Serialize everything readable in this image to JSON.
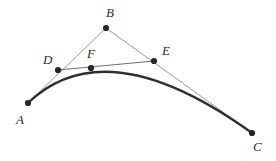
{
  "figure": {
    "canvas": {
      "width": 276,
      "height": 161
    },
    "colors": {
      "background": "#ffffff",
      "curve": "#2f2f2f",
      "control_line": "#8a8a8a",
      "chord_line": "#6e6e6e",
      "point_fill": "#262626",
      "label_text": "#2b2b2b"
    },
    "points": [
      {
        "id": "A",
        "label": "A",
        "x": 28,
        "y": 103,
        "label_x": 16,
        "label_y": 113,
        "role": "control-endpoint"
      },
      {
        "id": "B",
        "label": "B",
        "x": 106,
        "y": 28,
        "label_x": 106,
        "label_y": 6,
        "role": "control-middle"
      },
      {
        "id": "C",
        "label": "C",
        "x": 252,
        "y": 133,
        "label_x": 253,
        "label_y": 140,
        "role": "control-endpoint"
      },
      {
        "id": "D",
        "label": "D",
        "x": 58,
        "y": 70,
        "label_x": 43,
        "label_y": 53,
        "role": "subdivision-point-on-AB"
      },
      {
        "id": "E",
        "label": "E",
        "x": 154,
        "y": 61,
        "label_x": 162,
        "label_y": 44,
        "role": "subdivision-point-on-BC"
      },
      {
        "id": "F",
        "label": "F",
        "x": 91,
        "y": 68,
        "label_x": 87,
        "label_y": 47,
        "role": "curve-point-on-DE"
      }
    ],
    "segments": [
      {
        "id": "AB",
        "from": "A",
        "to": "B",
        "style": "thin-gray",
        "name": "control-line-ab"
      },
      {
        "id": "BC",
        "from": "B",
        "to": "C",
        "style": "thin-gray",
        "name": "control-line-bc"
      },
      {
        "id": "DE",
        "from": "D",
        "to": "E",
        "style": "thin-gray",
        "name": "chord-line-de"
      }
    ],
    "curve": {
      "name": "bezier-curve-afc",
      "type": "quadratic-bezier",
      "start": {
        "x": 28,
        "y": 103
      },
      "control": {
        "x": 106,
        "y": 28
      },
      "end": {
        "x": 252,
        "y": 133
      },
      "stroke_width": 2.4
    },
    "point_radius": 3.1
  }
}
